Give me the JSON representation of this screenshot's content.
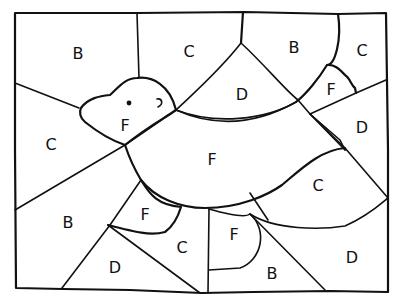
{
  "page": {
    "type": "color-by-letter coloring page"
  },
  "regions": [
    {
      "id": "r1",
      "letter": "B",
      "x": 78,
      "y": 54
    },
    {
      "id": "r2",
      "letter": "C",
      "x": 189,
      "y": 52
    },
    {
      "id": "r3",
      "letter": "B",
      "x": 294,
      "y": 48
    },
    {
      "id": "r4",
      "letter": "C",
      "x": 362,
      "y": 51
    },
    {
      "id": "r5",
      "letter": "D",
      "x": 242,
      "y": 95
    },
    {
      "id": "r6",
      "letter": "F",
      "x": 331,
      "y": 90
    },
    {
      "id": "r7",
      "letter": "F",
      "x": 125,
      "y": 126
    },
    {
      "id": "r8",
      "letter": "C",
      "x": 51,
      "y": 145
    },
    {
      "id": "r9",
      "letter": "D",
      "x": 362,
      "y": 128
    },
    {
      "id": "r10",
      "letter": "F",
      "x": 212,
      "y": 160
    },
    {
      "id": "r11",
      "letter": "C",
      "x": 318,
      "y": 186
    },
    {
      "id": "r12",
      "letter": "B",
      "x": 68,
      "y": 223
    },
    {
      "id": "r13",
      "letter": "F",
      "x": 145,
      "y": 215
    },
    {
      "id": "r14",
      "letter": "C",
      "x": 182,
      "y": 248
    },
    {
      "id": "r15",
      "letter": "F",
      "x": 234,
      "y": 235
    },
    {
      "id": "r16",
      "letter": "D",
      "x": 115,
      "y": 268
    },
    {
      "id": "r17",
      "letter": "B",
      "x": 272,
      "y": 274
    },
    {
      "id": "r18",
      "letter": "D",
      "x": 352,
      "y": 258
    }
  ]
}
